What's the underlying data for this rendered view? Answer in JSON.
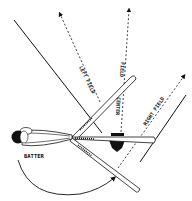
{
  "diagram": {
    "labels": {
      "batter": "BATTER",
      "left_field": "LEFT FIELD",
      "center_field_1": "CENTER",
      "center_field_2": "FIELD",
      "right_field": "RIGHT FIELD"
    },
    "colors": {
      "ink": "#111111",
      "background": "#ffffff"
    }
  }
}
